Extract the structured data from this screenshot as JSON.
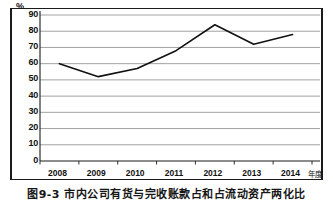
{
  "figure": {
    "caption": "图9-3  市内公司有货与完收账款占和占流动资产两化比",
    "yaxis_unit": "%",
    "xaxis_title": "年度"
  },
  "chart_data": {
    "type": "line",
    "title": "",
    "xlabel": "年度",
    "ylabel": "%",
    "categories": [
      "2008",
      "2009",
      "2010",
      "2011",
      "2012",
      "2013",
      "2014"
    ],
    "values": [
      60,
      52,
      57,
      68,
      84,
      72,
      78
    ],
    "series": [
      {
        "name": "series-1",
        "values": [
          60,
          52,
          57,
          68,
          84,
          72,
          78
        ],
        "color": "#111111"
      }
    ],
    "ylim": [
      0,
      90
    ],
    "ytick_values": [
      0,
      10,
      20,
      30,
      40,
      50,
      60,
      70,
      80,
      90
    ],
    "ytick_labels": [
      "0",
      "10",
      "20",
      "30",
      "40",
      "50",
      "60",
      "70",
      "80",
      "90"
    ],
    "grid": true,
    "grid_axis": "y",
    "legend": false,
    "markers": false,
    "line_width": 1.6,
    "grid_color": "#8a8a8a",
    "axis_color": "#1a1a1a",
    "background": "#ffffff"
  }
}
